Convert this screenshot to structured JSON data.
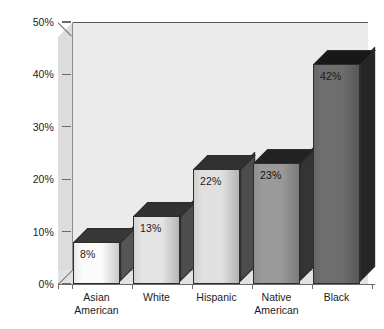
{
  "chart_data": {
    "type": "bar",
    "title": "",
    "subtitle": "",
    "xlabel": "",
    "ylabel": "",
    "categories": [
      "Asian American",
      "White",
      "Hispanic",
      "Native American",
      "Black"
    ],
    "values": [
      8,
      13,
      22,
      23,
      42
    ],
    "data_labels": [
      "8%",
      "13%",
      "22%",
      "23%",
      "42%"
    ],
    "ylim": [
      0,
      50
    ],
    "yticks": [
      0,
      10,
      20,
      30,
      40,
      50
    ],
    "ytick_labels": [
      "0%",
      "10%",
      "20%",
      "30%",
      "40%",
      "50%"
    ],
    "grid": false,
    "legend": "none",
    "style": "3d-column",
    "bar_colors": [
      "#fbfbfb",
      "#e4e4e4",
      "#e0e0e0",
      "#9a9a9a",
      "#6e6e6e"
    ],
    "bar_label_colors": [
      "#1c1c1c",
      "#1c1c1c",
      "#1c1c1c",
      "#111111",
      "#1a1a1a"
    ]
  },
  "category_labels": [
    {
      "line1": "Asian",
      "line2": "American"
    },
    {
      "line1": "White",
      "line2": ""
    },
    {
      "line1": "Hispanic",
      "line2": ""
    },
    {
      "line1": "Native",
      "line2": "American"
    },
    {
      "line1": "Black",
      "line2": ""
    }
  ],
  "colors": {
    "plot_background": "#ebebeb",
    "side_wall": "#dcdcdc",
    "floor": "#e2e2e2",
    "axis": "#6b6b6b",
    "text": "#1c1c1c",
    "bar_outline": "#2d2d2d"
  }
}
